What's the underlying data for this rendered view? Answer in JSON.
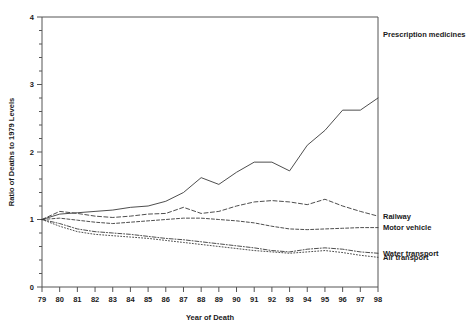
{
  "chart_data": {
    "type": "line",
    "title": "",
    "xlabel": "Year of Death",
    "ylabel": "Ratio of Deaths to 1979 Levels",
    "x": [
      79,
      80,
      81,
      82,
      83,
      84,
      85,
      86,
      87,
      88,
      89,
      90,
      91,
      92,
      93,
      94,
      95,
      96,
      97,
      98
    ],
    "x_tick_labels": [
      "79",
      "80",
      "81",
      "82",
      "83",
      "84",
      "85",
      "86",
      "87",
      "88",
      "89",
      "90",
      "91",
      "92",
      "93",
      "94",
      "95",
      "96",
      "97",
      "98"
    ],
    "xlim": [
      79,
      98
    ],
    "ylim": [
      0,
      4
    ],
    "y_tick_labels": [
      "0",
      "1",
      "2",
      "3",
      "4"
    ],
    "y_ticks_major": [
      0,
      1,
      2,
      3,
      4
    ],
    "y_minor_tick_step": 0.2,
    "grid": false,
    "legend_position": "right-inline-labels",
    "series": [
      {
        "name": "Prescription medicines",
        "style": "solid",
        "label_x": 98,
        "label_y": 3.75,
        "values": [
          1.0,
          1.08,
          1.1,
          1.12,
          1.14,
          1.18,
          1.2,
          1.27,
          1.4,
          1.62,
          1.52,
          1.7,
          1.85,
          1.85,
          1.72,
          2.1,
          2.32,
          2.62,
          2.62,
          2.8
        ]
      },
      {
        "name": "Railway",
        "style": "dashed",
        "label_x": 98,
        "label_y": 1.05,
        "values": [
          1.0,
          1.12,
          1.09,
          1.05,
          1.03,
          1.05,
          1.08,
          1.09,
          1.18,
          1.09,
          1.12,
          1.2,
          1.26,
          1.28,
          1.26,
          1.22,
          1.3,
          1.2,
          1.12,
          1.05
        ]
      },
      {
        "name": "Motor vehicle",
        "style": "dashed-fine",
        "label_x": 98,
        "label_y": 0.88,
        "values": [
          1.0,
          1.02,
          0.99,
          0.96,
          0.94,
          0.96,
          0.98,
          1.0,
          1.02,
          1.02,
          1.0,
          0.98,
          0.95,
          0.9,
          0.86,
          0.85,
          0.86,
          0.87,
          0.88,
          0.88
        ]
      },
      {
        "name": "Water transport",
        "style": "dash-dot",
        "label_x": 98,
        "label_y": 0.5,
        "values": [
          1.0,
          0.94,
          0.86,
          0.82,
          0.8,
          0.78,
          0.75,
          0.72,
          0.7,
          0.67,
          0.64,
          0.61,
          0.58,
          0.54,
          0.52,
          0.56,
          0.58,
          0.56,
          0.52,
          0.5
        ]
      },
      {
        "name": "Air transport",
        "style": "dotted",
        "label_x": 98,
        "label_y": 0.44,
        "values": [
          1.0,
          0.9,
          0.82,
          0.78,
          0.76,
          0.74,
          0.72,
          0.69,
          0.66,
          0.63,
          0.6,
          0.57,
          0.54,
          0.52,
          0.5,
          0.52,
          0.54,
          0.51,
          0.47,
          0.44
        ]
      }
    ]
  },
  "axes": {
    "x_title": "Year of Death",
    "y_title": "Ratio of Deaths to 1979 Levels"
  },
  "series_labels": {
    "prescription": "Prescription medicines",
    "railway": "Railway",
    "motor_vehicle": "Motor vehicle",
    "water_transport": "Water transport",
    "air_transport": "Air transport"
  }
}
